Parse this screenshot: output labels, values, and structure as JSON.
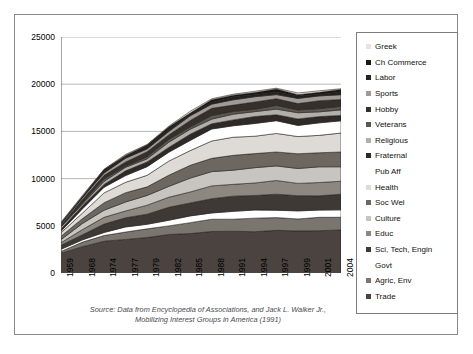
{
  "chart_data": {
    "type": "area",
    "title": "",
    "xlabel": "",
    "ylabel": "",
    "ylim": [
      0,
      25000
    ],
    "yticks": [
      "0",
      "5000",
      "10000",
      "15000",
      "20000",
      "25000"
    ],
    "grid": true,
    "legend_position": "right",
    "stacked": true,
    "caption_line1": "Source: Data from Encyclopedia of Associations, and Jack L. Walker Jr.,",
    "caption_line2": "Mobilizing Interest Groups in America (1991)",
    "categories": [
      "1959",
      "1968",
      "1974",
      "1977",
      "1979",
      "1982",
      "1985",
      "1988",
      "1991",
      "1994",
      "1997",
      "1999",
      "2001",
      "2004"
    ],
    "series": [
      {
        "name": "Trade",
        "swatch": "#4a433f",
        "values": [
          2100,
          2800,
          3300,
          3600,
          3800,
          4050,
          4200,
          4350,
          4400,
          4450,
          4500,
          4450,
          4480,
          4500
        ]
      },
      {
        "name": "Agric, Env",
        "swatch": "#7b7570",
        "values": [
          260,
          430,
          640,
          760,
          850,
          1000,
          1150,
          1280,
          1320,
          1350,
          1380,
          1340,
          1360,
          1380
        ]
      },
      {
        "name": "Govt",
        "swatch": "#ffffff",
        "values": [
          170,
          280,
          390,
          450,
          500,
          590,
          680,
          760,
          790,
          810,
          830,
          800,
          815,
          830
        ]
      },
      {
        "name": "Sci, Tech, Engin",
        "swatch": "#3f3935",
        "values": [
          380,
          620,
          860,
          1000,
          1100,
          1280,
          1420,
          1540,
          1580,
          1600,
          1630,
          1580,
          1600,
          1620
        ]
      },
      {
        "name": "Educ",
        "swatch": "#8d8781",
        "values": [
          300,
          500,
          700,
          820,
          900,
          1050,
          1180,
          1290,
          1330,
          1350,
          1380,
          1340,
          1360,
          1380
        ]
      },
      {
        "name": "Culture",
        "swatch": "#c8c4c0",
        "values": [
          330,
          560,
          800,
          940,
          1030,
          1220,
          1380,
          1500,
          1550,
          1580,
          1610,
          1560,
          1580,
          1600
        ]
      },
      {
        "name": "Soc Wel",
        "swatch": "#6d6762",
        "values": [
          320,
          540,
          780,
          910,
          1000,
          1180,
          1330,
          1450,
          1490,
          1520,
          1550,
          1500,
          1520,
          1540
        ]
      },
      {
        "name": "Health",
        "swatch": "#dedad6",
        "values": [
          390,
          660,
          950,
          1120,
          1230,
          1460,
          1650,
          1800,
          1860,
          1890,
          1920,
          1870,
          1890,
          1910
        ]
      },
      {
        "name": "Pub Aff",
        "swatch": "#ffffff",
        "values": [
          240,
          420,
          620,
          740,
          820,
          980,
          1120,
          1230,
          1270,
          1290,
          1310,
          1270,
          1290,
          1310
        ]
      },
      {
        "name": "Fraternal",
        "swatch": "#2f2a27",
        "values": [
          190,
          300,
          400,
          450,
          480,
          540,
          590,
          630,
          650,
          660,
          670,
          650,
          660,
          665
        ]
      },
      {
        "name": "Religious",
        "swatch": "#b2aea9",
        "values": [
          140,
          230,
          320,
          370,
          400,
          460,
          510,
          550,
          565,
          575,
          585,
          565,
          575,
          580
        ]
      },
      {
        "name": "Veterans",
        "swatch": "#5c5751",
        "values": [
          90,
          140,
          190,
          215,
          230,
          260,
          290,
          310,
          320,
          325,
          330,
          320,
          325,
          330
        ]
      },
      {
        "name": "Hobby",
        "swatch": "#35302c",
        "values": [
          170,
          280,
          390,
          450,
          490,
          570,
          640,
          700,
          720,
          735,
          750,
          725,
          735,
          745
        ]
      },
      {
        "name": "Sports",
        "swatch": "#a09b96",
        "values": [
          110,
          190,
          270,
          310,
          340,
          400,
          450,
          490,
          505,
          515,
          525,
          510,
          515,
          520
        ]
      },
      {
        "name": "Labor",
        "swatch": "#262220",
        "values": [
          90,
          130,
          170,
          185,
          195,
          215,
          230,
          240,
          245,
          248,
          250,
          243,
          246,
          250
        ]
      },
      {
        "name": "Ch Commerce",
        "swatch": "#1a1715",
        "values": [
          60,
          95,
          130,
          150,
          160,
          180,
          200,
          215,
          220,
          224,
          228,
          221,
          224,
          228
        ]
      },
      {
        "name": "Greek",
        "swatch": "#e6e3e0",
        "values": [
          40,
          60,
          80,
          90,
          95,
          105,
          115,
          122,
          125,
          127,
          130,
          126,
          128,
          130
        ]
      }
    ]
  },
  "legend": {
    "items": [
      {
        "label": "Greek"
      },
      {
        "label": "Ch Commerce"
      },
      {
        "label": "Labor"
      },
      {
        "label": "Sports"
      },
      {
        "label": "Hobby"
      },
      {
        "label": "Veterans"
      },
      {
        "label": "Religious"
      },
      {
        "label": "Fraternal"
      },
      {
        "label": "Pub Aff"
      },
      {
        "label": "Health"
      },
      {
        "label": "Soc Wel"
      },
      {
        "label": "Culture"
      },
      {
        "label": "Educ"
      },
      {
        "label": "Sci, Tech, Engin"
      },
      {
        "label": "Govt"
      },
      {
        "label": "Agric, Env"
      },
      {
        "label": "Trade"
      }
    ]
  }
}
